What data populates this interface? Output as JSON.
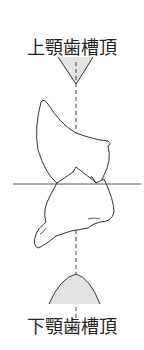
{
  "diagram": {
    "top_cut_text": "",
    "upper_label": "上顎歯槽頂",
    "lower_label": "下顎歯槽頂",
    "colors": {
      "line": "#333333",
      "ridge_fill": "#d9d9d9",
      "dashed_line": "#444444"
    }
  }
}
